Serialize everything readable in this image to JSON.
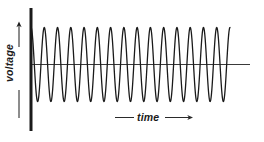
{
  "figure": {
    "title": "",
    "background_color": "#ffffff",
    "width": 264,
    "height": 142
  },
  "axes": {
    "vertical": {
      "label": "voltage",
      "orientation": "rotated-90-ccw",
      "arrow_direction": "up",
      "has_tail_line": true,
      "color": "#1a1a1a",
      "x": 31,
      "y_top": 8,
      "y_bottom": 131,
      "stroke_width": 3
    },
    "horizontal": {
      "label": "time",
      "orientation": "horizontal",
      "arrow_direction": "right",
      "has_tail_line": true,
      "color": "#3a3a3a",
      "y": 64.5,
      "x_start": 31,
      "x_end": 250,
      "stroke_width": 1
    }
  },
  "chart_data": {
    "type": "line",
    "title": "",
    "xlabel": "time",
    "ylabel": "voltage",
    "waveform": "sine",
    "cycles": 15,
    "amplitude": 37,
    "baseline_y": 64.5,
    "x_start": 31,
    "x_end": 230,
    "phase": "starts at trough rising",
    "stroke_color": "#1a1a1a",
    "stroke_width": 1.3,
    "grid": false,
    "legend": false,
    "xlim": [
      0,
      15
    ],
    "ylim": [
      -1,
      1
    ]
  },
  "annotations": {
    "voltage_arrow_name": "up-arrow-icon",
    "time_arrow_name": "right-arrow-icon"
  }
}
